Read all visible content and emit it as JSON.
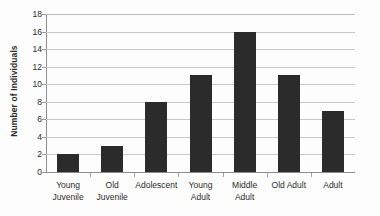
{
  "chart_data": {
    "type": "bar",
    "title": "",
    "xlabel": "",
    "ylabel": "Number of Individuals",
    "categories": [
      "Young Juvenile",
      "Old Juvenile",
      "Adolescent",
      "Young Adult",
      "Middle Adult",
      "Old Adult",
      "Adult"
    ],
    "category_lines": [
      [
        "Young",
        "Juvenile"
      ],
      [
        "Old",
        "Juvenile"
      ],
      [
        "Adolescent"
      ],
      [
        "Young",
        "Adult"
      ],
      [
        "Middle",
        "Adult"
      ],
      [
        "Old Adult"
      ],
      [
        "Adult"
      ]
    ],
    "values": [
      2,
      3,
      8,
      11,
      16,
      11,
      7
    ],
    "ylim": [
      0,
      18
    ],
    "ytick_values": [
      0,
      2,
      4,
      6,
      8,
      10,
      12,
      14,
      16,
      18
    ],
    "ytick_labels": [
      "0",
      "2",
      "4",
      "6",
      "8",
      "10",
      "12",
      "14",
      "16",
      "18"
    ],
    "grid": true,
    "grid_axis": "y",
    "legend": false,
    "legend_position": "none",
    "bar_color": "#2b2b2b",
    "gridline_color": "#c9c9c9",
    "axis_color": "#8d8d8d",
    "background_color": "#fdfdfd"
  }
}
